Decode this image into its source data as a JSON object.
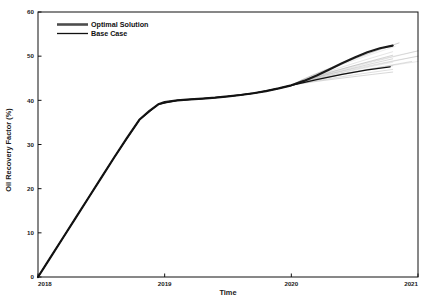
{
  "chart_data": {
    "type": "line",
    "title": "",
    "xlabel": "Time",
    "ylabel": "Oil Recovery Factor (%)",
    "xlim": [
      2018,
      2021
    ],
    "ylim": [
      0,
      60
    ],
    "xticks": [
      "2018",
      "2019",
      "2020",
      "2021"
    ],
    "xtick_values": [
      2018,
      2019,
      2020,
      2021
    ],
    "yticks": [
      "0",
      "10",
      "20",
      "30",
      "40",
      "50",
      "60"
    ],
    "ytick_values": [
      0,
      10,
      20,
      30,
      40,
      50,
      60
    ],
    "grid": false,
    "legend_position": "top-left",
    "legend": [
      {
        "name": "Optimal Solution",
        "color": "#4d4d4d",
        "width": 2.6
      },
      {
        "name": "Base Case",
        "color": "#111111",
        "width": 1.2
      }
    ],
    "series": [
      {
        "name": "Optimal Solution",
        "color": "#1a1a1a",
        "width": 2.2,
        "x": [
          2018.0,
          2018.1,
          2018.2,
          2018.3,
          2018.4,
          2018.5,
          2018.6,
          2018.7,
          2018.8,
          2018.88,
          2018.95,
          2019.0,
          2019.1,
          2019.2,
          2019.3,
          2019.4,
          2019.5,
          2019.6,
          2019.7,
          2019.8,
          2019.9,
          2020.0,
          2020.1,
          2020.2,
          2020.3,
          2020.4,
          2020.5,
          2020.6,
          2020.7,
          2020.8
        ],
        "y": [
          0.0,
          4.5,
          9.0,
          13.5,
          18.0,
          22.5,
          27.0,
          31.4,
          35.6,
          37.6,
          39.1,
          39.6,
          40.0,
          40.2,
          40.4,
          40.6,
          40.9,
          41.2,
          41.6,
          42.1,
          42.7,
          43.4,
          44.4,
          45.6,
          47.0,
          48.4,
          49.7,
          50.9,
          51.8,
          52.4
        ]
      },
      {
        "name": "Base Case",
        "color": "#111111",
        "width": 1.3,
        "x": [
          2018.0,
          2018.2,
          2018.4,
          2018.6,
          2018.8,
          2018.95,
          2019.1,
          2019.3,
          2019.5,
          2019.7,
          2019.9,
          2020.0,
          2020.2,
          2020.4,
          2020.6,
          2020.78
        ],
        "y": [
          0.0,
          9.0,
          18.0,
          27.0,
          35.6,
          39.1,
          40.0,
          40.4,
          40.9,
          41.6,
          42.7,
          43.4,
          44.7,
          45.9,
          46.9,
          47.6
        ]
      }
    ],
    "realizations_label": "ensemble realizations (light grey)",
    "realizations_count": 22,
    "branch_point": {
      "x": 2020.0,
      "y": 43.4
    },
    "realization_endpoints": [
      {
        "x": 2021.0,
        "y": 51.2
      },
      {
        "x": 2021.0,
        "y": 50.0
      },
      {
        "x": 2020.95,
        "y": 48.8
      },
      {
        "x": 2020.85,
        "y": 53.0
      },
      {
        "x": 2020.82,
        "y": 52.2
      },
      {
        "x": 2020.8,
        "y": 51.0
      },
      {
        "x": 2020.8,
        "y": 50.2
      },
      {
        "x": 2020.8,
        "y": 49.4
      },
      {
        "x": 2020.8,
        "y": 48.6
      },
      {
        "x": 2020.8,
        "y": 47.8
      },
      {
        "x": 2020.8,
        "y": 47.0
      },
      {
        "x": 2020.8,
        "y": 46.4
      }
    ]
  },
  "axes": {
    "x_title": "Time",
    "y_title": "Oil Recovery Factor (%)"
  }
}
